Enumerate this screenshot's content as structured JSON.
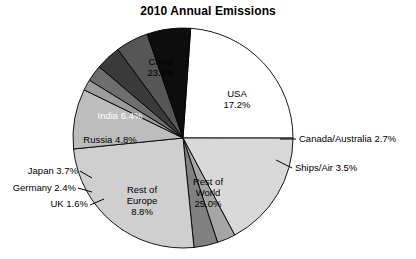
{
  "title": "2010 Annual Emissions",
  "chart_data": {
    "type": "pie",
    "title": "2010 Annual Emissions",
    "xlabel": "",
    "ylabel": "",
    "units": "percent",
    "legend": "none",
    "grid": false,
    "labels": [
      "China",
      "USA",
      "Canada/Australia",
      "Ships/Air",
      "Rest of World",
      "Rest of Europe",
      "UK",
      "Germany",
      "Japan",
      "Russia",
      "India"
    ],
    "values": [
      23.9,
      17.2,
      2.7,
      3.5,
      25.0,
      8.8,
      1.6,
      2.4,
      3.7,
      4.8,
      6.4
    ],
    "colors": [
      "#ffffff",
      "#d9d9d9",
      "#a6a6a6",
      "#808080",
      "#cfcfcf",
      "#bdbdbd",
      "#9c9c9c",
      "#6e6e6e",
      "#3a3a3a",
      "#565656",
      "#0d0d0d"
    ],
    "slices": [
      {
        "name": "China",
        "value": 23.9,
        "display": "China\n23.9%",
        "color": "#ffffff",
        "label_placement": "inside",
        "text_color": "#000000"
      },
      {
        "name": "USA",
        "value": 17.2,
        "display": "USA\n17.2%",
        "color": "#d9d9d9",
        "label_placement": "inside",
        "text_color": "#000000"
      },
      {
        "name": "Canada/Australia",
        "value": 2.7,
        "display": "Canada/Australia 2.7%",
        "color": "#a6a6a6",
        "label_placement": "outside-right",
        "text_color": "#000000"
      },
      {
        "name": "Ships/Air",
        "value": 3.5,
        "display": "Ships/Air 3.5%",
        "color": "#808080",
        "label_placement": "outside-right",
        "text_color": "#000000"
      },
      {
        "name": "Rest of World",
        "value": 25.0,
        "display": "Rest of\nWorld\n25.0%",
        "color": "#cfcfcf",
        "label_placement": "inside",
        "text_color": "#000000"
      },
      {
        "name": "Rest of Europe",
        "value": 8.8,
        "display": "Rest of\nEurope\n8.8%",
        "color": "#bdbdbd",
        "label_placement": "inside",
        "text_color": "#000000"
      },
      {
        "name": "UK",
        "value": 1.6,
        "display": "UK 1.6%",
        "color": "#9c9c9c",
        "label_placement": "outside-left",
        "text_color": "#000000"
      },
      {
        "name": "Germany",
        "value": 2.4,
        "display": "Germany 2.4%",
        "color": "#6e6e6e",
        "label_placement": "outside-left",
        "text_color": "#000000"
      },
      {
        "name": "Japan",
        "value": 3.7,
        "display": "Japan 3.7%",
        "color": "#3a3a3a",
        "label_placement": "outside-left",
        "text_color": "#000000"
      },
      {
        "name": "Russia",
        "value": 4.8,
        "display": "Russia 4.8%",
        "color": "#565656",
        "label_placement": "inside",
        "text_color": "#000000"
      },
      {
        "name": "India",
        "value": 6.4,
        "display": "India 6.4%",
        "color": "#0d0d0d",
        "label_placement": "inside",
        "text_color": "#ffffff"
      }
    ]
  },
  "labels": {
    "china": "China\n23.9%",
    "usa": "USA\n17.2%",
    "canada_australia": "Canada/Australia 2.7%",
    "ships_air": "Ships/Air 3.5%",
    "rest_of_world": "Rest of\nWorld\n25.0%",
    "rest_of_europe": "Rest of\nEurope\n8.8%",
    "uk": "UK 1.6%",
    "germany": "Germany 2.4%",
    "japan": "Japan 3.7%",
    "russia": "Russia 4.8%",
    "india": "India 6.4%"
  }
}
